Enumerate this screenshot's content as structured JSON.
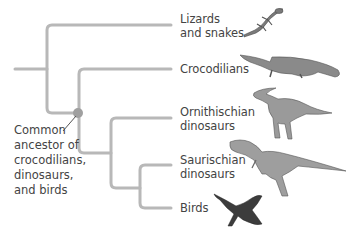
{
  "diagram": {
    "type": "phylogenetic-tree",
    "colors": {
      "branch": "#b8b8b8",
      "node": "#a0a0a0",
      "pointer": "#555555",
      "text": "#444444"
    },
    "taxa": [
      {
        "id": "lizards",
        "lines": [
          "Lizards",
          "and snakes"
        ],
        "icon": "lizard-icon"
      },
      {
        "id": "crocodilians",
        "lines": [
          "Crocodilians"
        ],
        "icon": "crocodile-icon"
      },
      {
        "id": "ornithischian",
        "lines": [
          "Ornithischian",
          "dinosaurs"
        ],
        "icon": "parasaurolophus-icon"
      },
      {
        "id": "saurischian",
        "lines": [
          "Saurischian",
          "dinosaurs"
        ],
        "icon": "theropod-icon"
      },
      {
        "id": "birds",
        "lines": [
          "Birds"
        ],
        "icon": "bird-icon"
      }
    ],
    "ancestor_label": {
      "lines": [
        "Common",
        "ancestor of",
        "crocodilians,",
        "dinosaurs,",
        "and birds"
      ]
    }
  }
}
